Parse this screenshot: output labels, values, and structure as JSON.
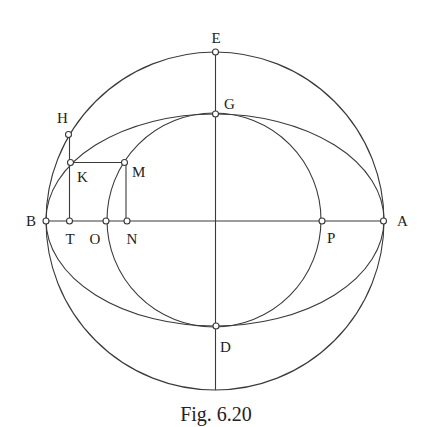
{
  "figure": {
    "caption": "Fig. 6.20",
    "points": {
      "E": {
        "label": "E"
      },
      "G": {
        "label": "G"
      },
      "H": {
        "label": "H"
      },
      "K": {
        "label": "K"
      },
      "M": {
        "label": "M"
      },
      "B": {
        "label": "B"
      },
      "T": {
        "label": "T"
      },
      "O": {
        "label": "O"
      },
      "N": {
        "label": "N"
      },
      "P": {
        "label": "P"
      },
      "A": {
        "label": "A"
      },
      "D": {
        "label": "D"
      }
    },
    "curves": [
      {
        "name": "outer-circle",
        "through": [
          "A",
          "E",
          "B"
        ]
      },
      {
        "name": "ellipse",
        "through": [
          "A",
          "G",
          "B",
          "D"
        ]
      },
      {
        "name": "inner-circle",
        "through": [
          "G",
          "P",
          "D",
          "O",
          "M"
        ]
      }
    ],
    "segments": [
      [
        "B",
        "A"
      ],
      [
        "E",
        "D"
      ],
      [
        "H",
        "T"
      ],
      [
        "K",
        "M"
      ],
      [
        "M",
        "N"
      ]
    ]
  }
}
